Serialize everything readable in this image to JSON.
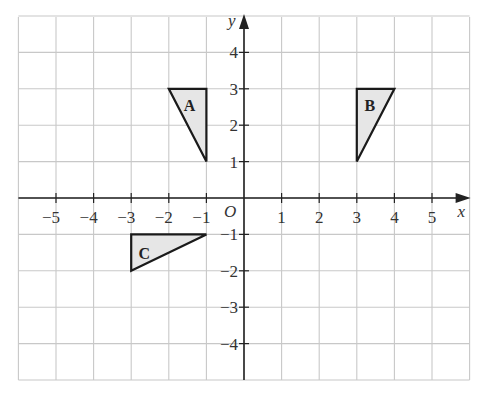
{
  "diagram": {
    "type": "coordinate-grid",
    "x_range": [
      -6,
      6
    ],
    "y_range": [
      -5,
      5
    ],
    "axis_labels": {
      "x": "x",
      "y": "y",
      "origin": "O"
    },
    "x_ticks": [
      -5,
      -4,
      -3,
      -2,
      -1,
      1,
      2,
      3,
      4,
      5
    ],
    "y_ticks": [
      4,
      3,
      2,
      1,
      -1,
      -2,
      -3,
      -4
    ],
    "colors": {
      "grid": "#c8c8c8",
      "axis": "#222222",
      "shape_fill": "#e6e6e6",
      "shape_stroke": "#1a1a1a"
    },
    "shapes": [
      {
        "label": "A",
        "vertices": [
          [
            -2,
            3
          ],
          [
            -1,
            3
          ],
          [
            -1,
            1
          ]
        ],
        "label_pos": [
          -1.45,
          2.55
        ]
      },
      {
        "label": "B",
        "vertices": [
          [
            3,
            3
          ],
          [
            4,
            3
          ],
          [
            3,
            1
          ]
        ],
        "label_pos": [
          3.35,
          2.55
        ]
      },
      {
        "label": "C",
        "vertices": [
          [
            -3,
            -1
          ],
          [
            -1,
            -1
          ],
          [
            -3,
            -2
          ]
        ],
        "label_pos": [
          -2.65,
          -1.5
        ]
      }
    ]
  }
}
